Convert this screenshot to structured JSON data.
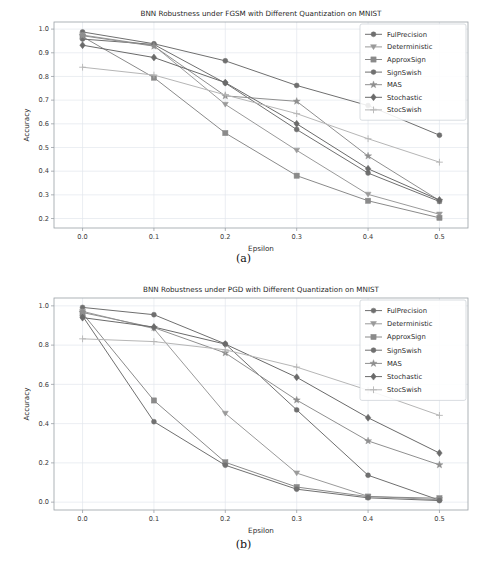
{
  "figure": {
    "captions": [
      {
        "id": "a",
        "text": "(a)"
      },
      {
        "id": "b",
        "text": "(b)"
      }
    ]
  },
  "chart_data": [
    {
      "panel": "a",
      "type": "line",
      "title": "BNN Robustness under FGSM with Different Quantization on MNIST",
      "xlabel": "Epsilon",
      "ylabel": "Accuracy",
      "x": [
        0.0,
        0.1,
        0.2,
        0.3,
        0.4,
        0.5
      ],
      "xticklabels": [
        "0.0",
        "0.1",
        "0.2",
        "0.3",
        "0.4",
        "0.5"
      ],
      "yticks": [
        0.2,
        0.3,
        0.4,
        0.5,
        0.6,
        0.7,
        0.8,
        0.9,
        1.0
      ],
      "yticklabels": [
        "0.2",
        "0.3",
        "0.4",
        "0.5",
        "0.6",
        "0.7",
        "0.8",
        "0.9",
        "1.0"
      ],
      "xlim": [
        -0.04,
        0.54
      ],
      "ylim": [
        0.16,
        1.03
      ],
      "grid": true,
      "legend_position": "upper right",
      "series": [
        {
          "name": "FulPrecision",
          "marker": "circle",
          "color": "#6f6f6f",
          "values": [
            0.988,
            0.938,
            0.866,
            0.762,
            0.677,
            0.552
          ]
        },
        {
          "name": "Deterministic",
          "marker": "triangle",
          "color": "#9a9a9a",
          "values": [
            0.975,
            0.93,
            0.682,
            0.488,
            0.302,
            0.218
          ]
        },
        {
          "name": "ApproxSign",
          "marker": "square",
          "color": "#8a8a8a",
          "values": [
            0.968,
            0.795,
            0.561,
            0.381,
            0.275,
            0.203
          ]
        },
        {
          "name": "SignSwish",
          "marker": "circle",
          "color": "#707070",
          "values": [
            0.958,
            0.935,
            0.772,
            0.576,
            0.392,
            0.272
          ]
        },
        {
          "name": "MAS",
          "marker": "star",
          "color": "#8f8f8f",
          "values": [
            0.972,
            0.928,
            0.718,
            0.695,
            0.464,
            0.276
          ]
        },
        {
          "name": "Stochastic",
          "marker": "diamond",
          "color": "#6a6a6a",
          "values": [
            0.932,
            0.88,
            0.774,
            0.6,
            0.41,
            0.278
          ]
        },
        {
          "name": "StocSwish",
          "marker": "plus",
          "color": "#b6b6b6",
          "values": [
            0.839,
            0.806,
            0.722,
            0.643,
            0.537,
            0.438
          ]
        }
      ]
    },
    {
      "panel": "b",
      "type": "line",
      "title": "BNN Robustness under PGD with Different Quantization on MNIST",
      "xlabel": "Epsilon",
      "ylabel": "Accuracy",
      "x": [
        0.0,
        0.1,
        0.2,
        0.3,
        0.4,
        0.5
      ],
      "xticklabels": [
        "0.0",
        "0.1",
        "0.2",
        "0.3",
        "0.4",
        "0.5"
      ],
      "yticks": [
        0.0,
        0.2,
        0.4,
        0.6,
        0.8,
        1.0
      ],
      "yticklabels": [
        "0.0",
        "0.2",
        "0.4",
        "0.6",
        "0.8",
        "1.0"
      ],
      "xlim": [
        -0.04,
        0.54
      ],
      "ylim": [
        -0.04,
        1.04
      ],
      "grid": true,
      "legend_position": "upper right",
      "series": [
        {
          "name": "FulPrecision",
          "marker": "circle",
          "color": "#6f6f6f",
          "values": [
            0.992,
            0.955,
            0.806,
            0.47,
            0.137,
            0.01
          ]
        },
        {
          "name": "Deterministic",
          "marker": "triangle",
          "color": "#9a9a9a",
          "values": [
            0.972,
            0.884,
            0.452,
            0.148,
            0.03,
            0.012
          ]
        },
        {
          "name": "ApproxSign",
          "marker": "square",
          "color": "#8a8a8a",
          "values": [
            0.962,
            0.518,
            0.203,
            0.077,
            0.028,
            0.02
          ]
        },
        {
          "name": "SignSwish",
          "marker": "circle",
          "color": "#707070",
          "values": [
            0.948,
            0.41,
            0.188,
            0.066,
            0.022,
            0.008
          ]
        },
        {
          "name": "MAS",
          "marker": "star",
          "color": "#8f8f8f",
          "values": [
            0.966,
            0.889,
            0.76,
            0.52,
            0.312,
            0.19
          ]
        },
        {
          "name": "Stochastic",
          "marker": "diamond",
          "color": "#6a6a6a",
          "values": [
            0.94,
            0.892,
            0.805,
            0.636,
            0.43,
            0.25
          ]
        },
        {
          "name": "StocSwish",
          "marker": "plus",
          "color": "#b6b6b6",
          "values": [
            0.832,
            0.818,
            0.776,
            0.688,
            0.57,
            0.442
          ]
        }
      ]
    }
  ]
}
